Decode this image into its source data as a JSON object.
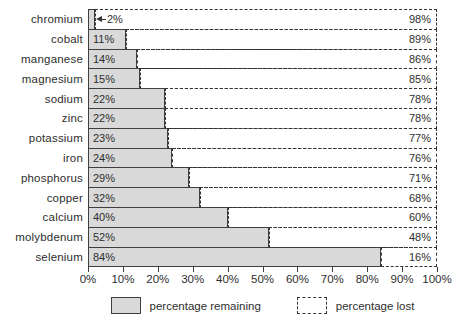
{
  "chart_data": {
    "type": "bar",
    "orientation": "horizontal",
    "categories": [
      "chromium",
      "cobalt",
      "manganese",
      "magnesium",
      "sodium",
      "zinc",
      "potassium",
      "iron",
      "phosphorus",
      "copper",
      "calcium",
      "molybdenum",
      "selenium"
    ],
    "series": [
      {
        "name": "percentage remaining",
        "values": [
          2,
          11,
          14,
          15,
          22,
          22,
          23,
          24,
          29,
          32,
          40,
          52,
          84
        ]
      },
      {
        "name": "percentage lost",
        "values": [
          98,
          89,
          86,
          85,
          78,
          78,
          77,
          76,
          71,
          68,
          60,
          48,
          16
        ]
      }
    ],
    "rows": [
      {
        "category": "chromium",
        "remaining": 2,
        "remaining_label": "2%",
        "lost": 98,
        "lost_label": "98%",
        "label_outside": true
      },
      {
        "category": "cobalt",
        "remaining": 11,
        "remaining_label": "11%",
        "lost": 89,
        "lost_label": "89%",
        "label_outside": false
      },
      {
        "category": "manganese",
        "remaining": 14,
        "remaining_label": "14%",
        "lost": 86,
        "lost_label": "86%",
        "label_outside": false
      },
      {
        "category": "magnesium",
        "remaining": 15,
        "remaining_label": "15%",
        "lost": 85,
        "lost_label": "85%",
        "label_outside": false
      },
      {
        "category": "sodium",
        "remaining": 22,
        "remaining_label": "22%",
        "lost": 78,
        "lost_label": "78%",
        "label_outside": false
      },
      {
        "category": "zinc",
        "remaining": 22,
        "remaining_label": "22%",
        "lost": 78,
        "lost_label": "78%",
        "label_outside": false
      },
      {
        "category": "potassium",
        "remaining": 23,
        "remaining_label": "23%",
        "lost": 77,
        "lost_label": "77%",
        "label_outside": false
      },
      {
        "category": "iron",
        "remaining": 24,
        "remaining_label": "24%",
        "lost": 76,
        "lost_label": "76%",
        "label_outside": false
      },
      {
        "category": "phosphorus",
        "remaining": 29,
        "remaining_label": "29%",
        "lost": 71,
        "lost_label": "71%",
        "label_outside": false
      },
      {
        "category": "copper",
        "remaining": 32,
        "remaining_label": "32%",
        "lost": 68,
        "lost_label": "68%",
        "label_outside": false
      },
      {
        "category": "calcium",
        "remaining": 40,
        "remaining_label": "40%",
        "lost": 60,
        "lost_label": "60%",
        "label_outside": false
      },
      {
        "category": "molybdenum",
        "remaining": 52,
        "remaining_label": "52%",
        "lost": 48,
        "lost_label": "48%",
        "label_outside": false
      },
      {
        "category": "selenium",
        "remaining": 84,
        "remaining_label": "84%",
        "lost": 16,
        "lost_label": "16%",
        "label_outside": false
      }
    ],
    "x_ticks": [
      "0%",
      "10%",
      "20%",
      "30%",
      "40%",
      "50%",
      "60%",
      "70%",
      "80%",
      "90%",
      "100%"
    ],
    "xlim": [
      0,
      100
    ],
    "grid": false,
    "legend_position": "bottom",
    "legend": [
      {
        "label": "percentage remaining",
        "style": "filled"
      },
      {
        "label": "percentage lost",
        "style": "dashed"
      }
    ],
    "colors": {
      "bar_fill": "#d9d9d9",
      "bar_border": "#3f3f3f",
      "dashed_line": "#333333",
      "text": "#2e2e2e",
      "background": "#ffffff"
    }
  }
}
